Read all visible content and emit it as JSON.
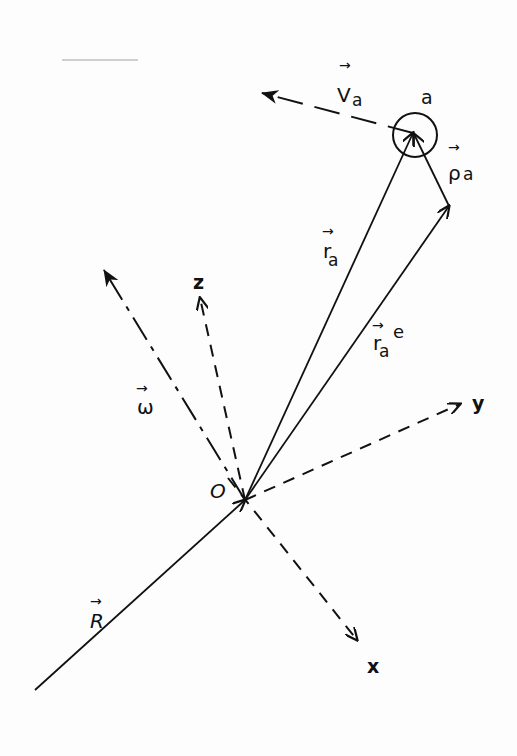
{
  "figure": {
    "colors": {
      "ink": "#111111",
      "paper": "#fdfdfd",
      "faint_line": "#cfcfcf"
    }
  },
  "labels": {
    "velocity": "V",
    "velocity_sub": "a",
    "particle": "a",
    "rho": "ρ",
    "rho_sub": "a",
    "r": "r",
    "r_sub": "a",
    "re": "r",
    "re_sub": "a",
    "re_sup": "e",
    "omega": "ω",
    "z_axis": "z",
    "y_axis": "y",
    "x_axis": "x",
    "origin": "O",
    "R": "R",
    "arrow": "→"
  },
  "vectors": [
    {
      "name": "R",
      "from": [
        35,
        690
      ],
      "to": [
        245,
        500
      ],
      "style": "solid"
    },
    {
      "name": "r_a",
      "from": [
        245,
        500
      ],
      "to": [
        413,
        133
      ],
      "style": "solid"
    },
    {
      "name": "r_a_e",
      "from": [
        245,
        500
      ],
      "to": [
        449,
        206
      ],
      "style": "solid"
    },
    {
      "name": "rho_a",
      "from": [
        449,
        206
      ],
      "to": [
        413,
        133
      ],
      "style": "solid"
    },
    {
      "name": "V_a",
      "from": [
        413,
        133
      ],
      "to": [
        262,
        93
      ],
      "style": "dashed"
    },
    {
      "name": "omega",
      "from": [
        245,
        500
      ],
      "to": [
        104,
        270
      ],
      "style": "dash-dot"
    },
    {
      "name": "z",
      "from": [
        245,
        500
      ],
      "to": [
        200,
        298
      ],
      "style": "dashed"
    },
    {
      "name": "y",
      "from": [
        245,
        500
      ],
      "to": [
        460,
        404
      ],
      "style": "dashed"
    },
    {
      "name": "x",
      "from": [
        245,
        500
      ],
      "to": [
        357,
        640
      ],
      "style": "dashed"
    }
  ],
  "particle_circle": {
    "cx": 415,
    "cy": 135,
    "r": 22
  }
}
